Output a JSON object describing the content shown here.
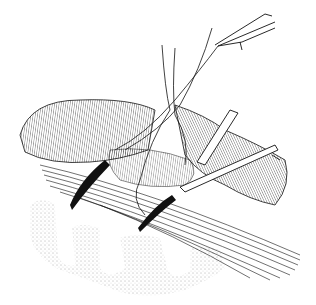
{
  "image": {
    "kind": "surgical line illustration",
    "description": "Black-and-white pen drawing of a surgical procedure: hatched tissue/muscle layers with fibrous strands, stippled bone-like structures below, surgical instruments (forceps, retractors, probe) and suture threads inserted from above-right.",
    "colors": {
      "ink": "#111111",
      "background": "#ffffff",
      "stipple": "#555555"
    },
    "elements": [
      "forceps-upper-right",
      "suture-threads",
      "retractor-right",
      "probe-instrument",
      "hatched-tissue-mass",
      "fibrous-strands",
      "stippled-bone",
      "needle-left",
      "needle-center"
    ]
  }
}
